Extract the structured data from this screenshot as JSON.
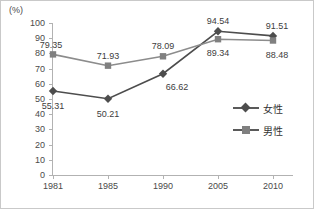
{
  "chart_data": {
    "type": "line",
    "title": "",
    "subtitle": "",
    "xlabel": "",
    "ylabel": "",
    "unit_label": "(%)",
    "categories": [
      "1981",
      "1985",
      "1990",
      "2005",
      "2010"
    ],
    "x": [
      1981,
      1985,
      1990,
      2005,
      2010
    ],
    "ylim": [
      0,
      100
    ],
    "yticks": [
      0,
      10,
      20,
      30,
      40,
      50,
      60,
      70,
      80,
      90,
      100
    ],
    "grid": false,
    "legend_position": "right",
    "series": [
      {
        "name": "女性",
        "marker": "diamond",
        "color": "#4d4d4d",
        "values": [
          55.31,
          50.21,
          66.62,
          94.54,
          91.51
        ],
        "labels": [
          "55.31",
          "50.21",
          "66.62",
          "94.54",
          "91.51"
        ]
      },
      {
        "name": "男性",
        "marker": "square",
        "color": "#808080",
        "values": [
          79.35,
          71.93,
          78.09,
          89.34,
          88.48
        ],
        "labels": [
          "79.35",
          "71.93",
          "78.09",
          "89.34",
          "88.48"
        ]
      }
    ]
  },
  "axis": {
    "unit": "(%)",
    "y_tick_labels": [
      "100",
      "90",
      "80",
      "70",
      "60",
      "50",
      "40",
      "30",
      "20",
      "10",
      "0"
    ],
    "x_tick_labels": [
      "1981",
      "1985",
      "1990",
      "2005",
      "2010"
    ]
  },
  "legend": {
    "items": [
      {
        "label": "女性",
        "marker": "diamond"
      },
      {
        "label": "男性",
        "marker": "square"
      }
    ]
  },
  "colors": {
    "female_line": "#4d4d4d",
    "male_line": "#8c8c8c",
    "axis": "#b2b2b2",
    "text": "#4a4a4a",
    "frame": "#c9c9c9",
    "background": "#ffffff"
  }
}
